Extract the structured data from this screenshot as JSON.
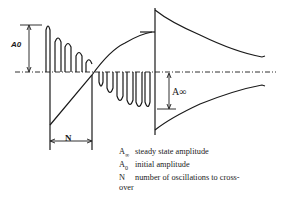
{
  "diagram": {
    "type": "oscillation-transient",
    "labels": {
      "a0": "A0",
      "a_inf": "A∞",
      "n": "N"
    },
    "legend": [
      {
        "symbol": "A",
        "sub": "∞",
        "text": "steady state amplitude"
      },
      {
        "symbol": "A",
        "sub": "0",
        "text": "initial amplitude"
      },
      {
        "symbol": "N",
        "sub": "",
        "text": "number of oscillations to  cross-"
      },
      {
        "symbol": "",
        "sub": "",
        "text": "over"
      }
    ],
    "colors": {
      "line": "#1a1a1a",
      "background": "#ffffff"
    }
  }
}
